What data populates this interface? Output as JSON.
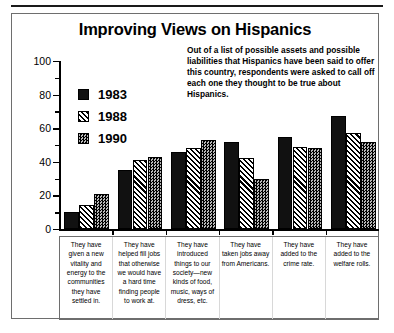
{
  "figure": {
    "title": "Improving Views on Hispanics",
    "description": "Out of a list of possible assets and possible liabilities that Hispanics have been said to offer this country, respondents were asked to call off each one they thought to be true about Hispanics."
  },
  "legend": {
    "position": "inside-top-left",
    "entries": [
      {
        "label": "1983",
        "pattern": "solid-black"
      },
      {
        "label": "1988",
        "pattern": "diagonal-hatch"
      },
      {
        "label": "1990",
        "pattern": "checkered-gray"
      }
    ]
  },
  "axis": {
    "y_ticks": [
      "100",
      "80",
      "60",
      "40",
      "20",
      "0"
    ],
    "y_min": 0,
    "y_max": 100,
    "y_major_step": 20,
    "y_minor_step": 10
  },
  "chart_data": {
    "type": "bar",
    "title": "Improving Views on Hispanics",
    "subtitle": "Out of a list of possible assets and possible liabilities that Hispanics have been said to offer this country, respondents were asked to call off each one they thought to be true about Hispanics.",
    "xlabel": "",
    "ylabel": "",
    "ylim": [
      0,
      100
    ],
    "yticks": [
      0,
      20,
      40,
      60,
      80,
      100
    ],
    "grid": false,
    "legend_position": "upper left",
    "categories": [
      "They have given a new vitality and energy to the communities they have settled in.",
      "They have helped fill jobs that otherwise we would have a hard time finding people to work at.",
      "They have introduced things to our society—new kinds of food, music, ways of dress, etc.",
      "They have taken jobs away from Americans.",
      "They have added to the crime rate.",
      "They have added to the welfare rolls."
    ],
    "series": [
      {
        "name": "1983",
        "values": [
          10,
          35,
          46,
          52,
          55,
          67
        ]
      },
      {
        "name": "1988",
        "values": [
          14,
          41,
          48,
          42,
          49,
          57
        ]
      },
      {
        "name": "1990",
        "values": [
          21,
          43,
          53,
          30,
          48,
          52
        ]
      }
    ]
  }
}
